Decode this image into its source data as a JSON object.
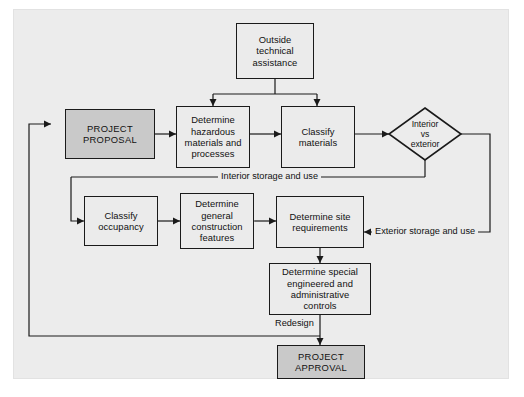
{
  "diagram": {
    "background_color": "#ececec",
    "accent_color": "#c9c9c9",
    "line_color": "#1a1a1a",
    "nodes": [
      {
        "id": "outside-technical-assistance",
        "label": "Outside\ntechnical\nassistance",
        "shape": "rect",
        "shaded": false
      },
      {
        "id": "project-proposal",
        "label": "PROJECT\nPROPOSAL",
        "shape": "rect",
        "shaded": true
      },
      {
        "id": "determine-hazardous-materials",
        "label": "Determine\nhazardous\nmaterials and\nprocesses",
        "shape": "rect",
        "shaded": false
      },
      {
        "id": "classify-materials",
        "label": "Classify\nmaterials",
        "shape": "rect",
        "shaded": false
      },
      {
        "id": "interior-vs-exterior",
        "label": "Interior\nvs\nexterior",
        "shape": "diamond",
        "shaded": false
      },
      {
        "id": "classify-occupancy",
        "label": "Classify\noccupancy",
        "shape": "rect",
        "shaded": false
      },
      {
        "id": "determine-general-construction-features",
        "label": "Determine\ngeneral\nconstruction\nfeatures",
        "shape": "rect",
        "shaded": false
      },
      {
        "id": "determine-site-requirements",
        "label": "Determine site\nrequirements",
        "shape": "rect",
        "shaded": false
      },
      {
        "id": "determine-special-controls",
        "label": "Determine special\nengineered and\nadministrative\ncontrols",
        "shape": "rect",
        "shaded": false
      },
      {
        "id": "project-approval",
        "label": "PROJECT\nAPPROVAL",
        "shape": "rect",
        "shaded": true
      }
    ],
    "edge_labels": [
      {
        "id": "interior-storage-and-use",
        "text": "Interior storage and use"
      },
      {
        "id": "exterior-storage-and-use",
        "text": "Exterior storage and use"
      },
      {
        "id": "redesign",
        "text": "Redesign"
      }
    ]
  },
  "nodes": {
    "outside_technical_assistance": {
      "line1": "Outside",
      "line2": "technical",
      "line3": "assistance"
    },
    "project_proposal": {
      "line1": "PROJECT",
      "line2": "PROPOSAL"
    },
    "determine_hazardous_materials": {
      "line1": "Determine",
      "line2": "hazardous",
      "line3": "materials and",
      "line4": "processes"
    },
    "classify_materials": {
      "line1": "Classify",
      "line2": "materials"
    },
    "interior_vs_exterior": {
      "line1": "Interior",
      "line2": "vs",
      "line3": "exterior"
    },
    "classify_occupancy": {
      "line1": "Classify",
      "line2": "occupancy"
    },
    "determine_general_construction_features": {
      "line1": "Determine",
      "line2": "general",
      "line3": "construction",
      "line4": "features"
    },
    "determine_site_requirements": {
      "line1": "Determine site",
      "line2": "requirements"
    },
    "determine_special_controls": {
      "line1": "Determine special",
      "line2": "engineered and",
      "line3": "administrative",
      "line4": "controls"
    },
    "project_approval": {
      "line1": "PROJECT",
      "line2": "APPROVAL"
    }
  },
  "labels": {
    "interior_storage": "Interior storage and use",
    "exterior_storage": "Exterior storage and use",
    "redesign": "Redesign"
  }
}
